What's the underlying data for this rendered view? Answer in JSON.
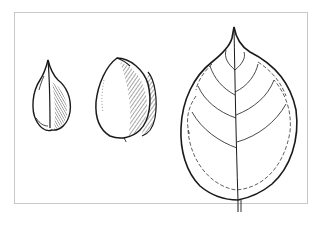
{
  "illustration": {
    "subject": "botanical line drawing",
    "items": [
      {
        "name": "seed-front-view"
      },
      {
        "name": "nut-side-view"
      },
      {
        "name": "leaf"
      }
    ],
    "colors": {
      "ink": "#1a1a1a",
      "background": "#ffffff",
      "frame": "#c8c8c8"
    }
  }
}
